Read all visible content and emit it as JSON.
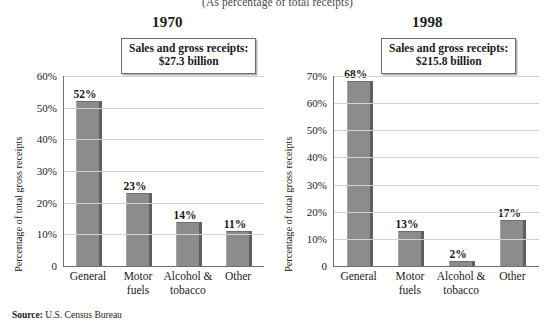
{
  "figure": {
    "subtitle": "(As percentage of total receipts)",
    "source_label": "Source:",
    "source_text": " U.S. Census Bureau",
    "axis_title": "Percentage of total gross receipts",
    "bar_color": "#8c8c8c",
    "bar_edge_color": "#5f5f5f",
    "gridline_color": "#d4d4d4",
    "axis_color": "#6f6f6f"
  },
  "panels": [
    {
      "year": "1970",
      "callout_line1": "Sales and gross receipts:",
      "callout_line2": "$27.3 billion"
    },
    {
      "year": "1998",
      "callout_line1": "Sales and gross receipts:",
      "callout_line2": "$215.8 billion"
    }
  ],
  "chart_data": [
    {
      "type": "bar",
      "title": "1970",
      "subtitle": "Sales and gross receipts: $27.3 billion",
      "xlabel": "",
      "ylabel": "Percentage of total gross receipts",
      "categories": [
        "General",
        "Motor fuels",
        "Alcohol & tobacco",
        "Other"
      ],
      "values": [
        52,
        23,
        14,
        11
      ],
      "data_labels": [
        "52%",
        "23%",
        "14%",
        "11%"
      ],
      "ylim": [
        0,
        60
      ],
      "yticks": [
        0,
        10,
        20,
        30,
        40,
        50,
        60
      ],
      "ytick_labels": [
        "0",
        "10%",
        "20%",
        "30%",
        "40%",
        "50%",
        "60%"
      ],
      "grid": true,
      "legend": false
    },
    {
      "type": "bar",
      "title": "1998",
      "subtitle": "Sales and gross receipts: $215.8 billion",
      "xlabel": "",
      "ylabel": "Percentage of total gross receipts",
      "categories": [
        "General",
        "Motor fuels",
        "Alcohol & tobacco",
        "Other"
      ],
      "values": [
        68,
        13,
        2,
        17
      ],
      "data_labels": [
        "68%",
        "13%",
        "2%",
        "17%"
      ],
      "ylim": [
        0,
        70
      ],
      "yticks": [
        0,
        10,
        20,
        30,
        40,
        50,
        60,
        70
      ],
      "ytick_labels": [
        "0",
        "10%",
        "20%",
        "30%",
        "40%",
        "50%",
        "60%",
        "70%"
      ],
      "grid": true,
      "legend": false
    }
  ]
}
